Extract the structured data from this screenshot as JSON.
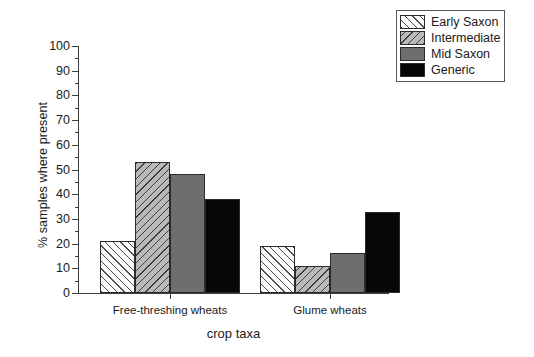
{
  "chart_data": {
    "type": "bar",
    "title": "",
    "xlabel": "crop taxa",
    "ylabel": "% samples where present",
    "categories": [
      "Free-threshing wheats",
      "Glume wheats"
    ],
    "series": [
      {
        "name": "Early Saxon",
        "values": [
          21,
          19
        ],
        "fill": "light-diagonal-hatch",
        "color": "#fbfbfb"
      },
      {
        "name": "Intermediate",
        "values": [
          53,
          11
        ],
        "fill": "grey-diagonal-hatch",
        "color": "#b9b9b9"
      },
      {
        "name": "Mid Saxon",
        "values": [
          48,
          16
        ],
        "fill": "solid",
        "color": "#6e6e6e"
      },
      {
        "name": "Generic",
        "values": [
          38,
          33
        ],
        "fill": "solid",
        "color": "#070707"
      }
    ],
    "ylim": [
      0,
      100
    ],
    "yticks": [
      0,
      10,
      20,
      30,
      40,
      50,
      60,
      70,
      80,
      90,
      100
    ],
    "ytick_labels": [
      "0",
      "10",
      "20",
      "30",
      "40",
      "50",
      "60",
      "70",
      "80",
      "90",
      "100"
    ],
    "grid": false,
    "legend_position": "top-right"
  },
  "legend": {
    "entries": [
      {
        "label": "Early Saxon"
      },
      {
        "label": "Intermediate"
      },
      {
        "label": "Mid Saxon"
      },
      {
        "label": "Generic"
      }
    ]
  },
  "axes": {
    "y_title": "% samples where present",
    "x_title": "crop taxa"
  }
}
